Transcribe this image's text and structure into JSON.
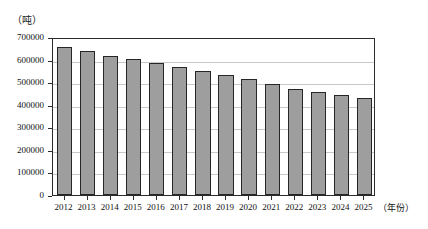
{
  "chart_data": {
    "type": "bar",
    "title": "",
    "xlabel": "（年份）",
    "ylabel": "（吨）",
    "categories": [
      "2012",
      "2013",
      "2014",
      "2015",
      "2016",
      "2017",
      "2018",
      "2019",
      "2020",
      "2021",
      "2022",
      "2023",
      "2024",
      "2025"
    ],
    "values": [
      655000,
      640000,
      618000,
      602000,
      583000,
      566000,
      548000,
      530000,
      512000,
      490000,
      468000,
      458000,
      445000,
      432000
    ],
    "ylim": [
      0,
      700000
    ],
    "yticks": [
      "0",
      "100000",
      "200000",
      "300000",
      "400000",
      "500000",
      "600000",
      "700000"
    ],
    "ytick_values": [
      0,
      100000,
      200000,
      300000,
      400000,
      500000,
      600000,
      700000
    ],
    "grid": true,
    "legend": false,
    "bar_color": "#9e9e9e",
    "bar_edge_color": "#262626",
    "grid_color": "#c9c9c9",
    "axis_color": "#2b2b2b",
    "background": "#ffffff"
  }
}
